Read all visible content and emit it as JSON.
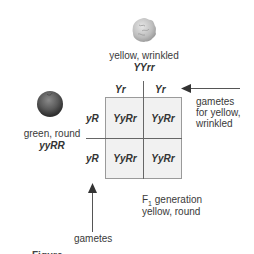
{
  "top_parent": {
    "phenotype": "yellow, wrinkled",
    "genotype": "YYrr",
    "icon": "wrinkled-pea-icon"
  },
  "left_parent": {
    "phenotype": "green, round",
    "genotype": "yyRR",
    "icon": "round-pea-icon"
  },
  "punnett": {
    "column_headers": [
      "Yr",
      "Yr"
    ],
    "row_headers": [
      "yR",
      "yR"
    ],
    "cells": [
      [
        "YyRr",
        "YyRr"
      ],
      [
        "YyRr",
        "YyRr"
      ]
    ]
  },
  "annotations": {
    "top_gametes": [
      "gametes",
      "for yellow,",
      "wrinkled"
    ],
    "left_gametes": "gametes",
    "f1_label_prefix": "F",
    "f1_label_sub": "1",
    "f1_label_suffix": " generation",
    "f1_phenotype": "yellow, round"
  },
  "caption_partial": "Figure"
}
